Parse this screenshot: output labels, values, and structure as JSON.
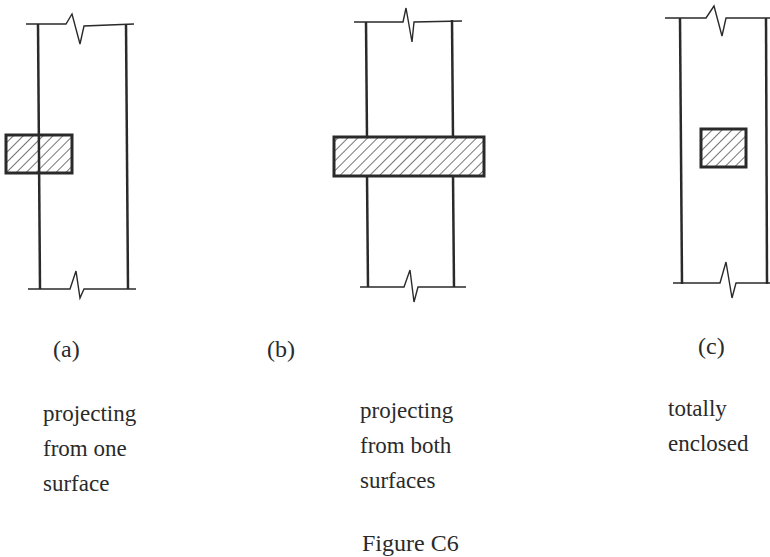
{
  "figure": {
    "caption": "Figure C6",
    "colors": {
      "ink": "#2a2a2a",
      "background": "#ffffff"
    },
    "panels": [
      {
        "id": "a",
        "label": "(a)",
        "description_lines": [
          "projecting",
          "from one",
          "surface"
        ],
        "element": "hatched-block"
      },
      {
        "id": "b",
        "label": "(b)",
        "description_lines": [
          "projecting",
          "from both",
          "surfaces"
        ],
        "element": "hatched-block"
      },
      {
        "id": "c",
        "label": "(c)",
        "description_lines": [
          "totally",
          "enclosed"
        ],
        "element": "hatched-block"
      }
    ]
  }
}
